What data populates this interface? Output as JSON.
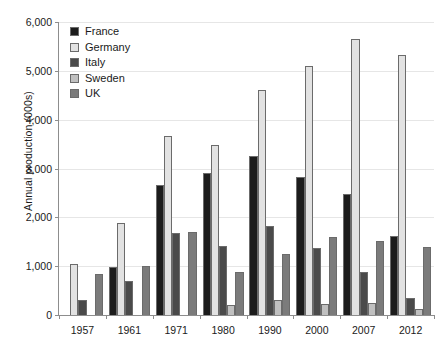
{
  "chart_data": {
    "type": "bar",
    "title": "",
    "xlabel": "",
    "ylabel": "Annual production (000s)",
    "categories": [
      "1957",
      "1961",
      "1971",
      "1980",
      "1990",
      "2000",
      "2007",
      "2012"
    ],
    "ylim": [
      0,
      6000
    ],
    "yticks": [
      0,
      1000,
      2000,
      3000,
      4000,
      5000,
      6000
    ],
    "ytick_labels": [
      "0",
      "1,000",
      "2,000",
      "3,000",
      "4,000",
      "5,000",
      "6,000"
    ],
    "grid": true,
    "legend_position": "top-left",
    "series": [
      {
        "name": "France",
        "color": "#1c1c1c",
        "values": [
          0,
          980,
          2660,
          2900,
          3250,
          2820,
          2480,
          1620
        ]
      },
      {
        "name": "Germany",
        "color": "#e2e2e2",
        "values": [
          1050,
          1890,
          3670,
          3480,
          4600,
          5100,
          5650,
          5320
        ]
      },
      {
        "name": "Italy",
        "color": "#4a4a4a",
        "values": [
          300,
          690,
          1680,
          1420,
          1830,
          1380,
          880,
          350
        ]
      },
      {
        "name": "Sweden",
        "color": "#c0c0c0",
        "values": [
          0,
          0,
          0,
          210,
          300,
          220,
          240,
          120
        ]
      },
      {
        "name": "UK",
        "color": "#7b7b7b",
        "values": [
          850,
          1000,
          1700,
          890,
          1250,
          1600,
          1520,
          1400
        ]
      }
    ]
  }
}
